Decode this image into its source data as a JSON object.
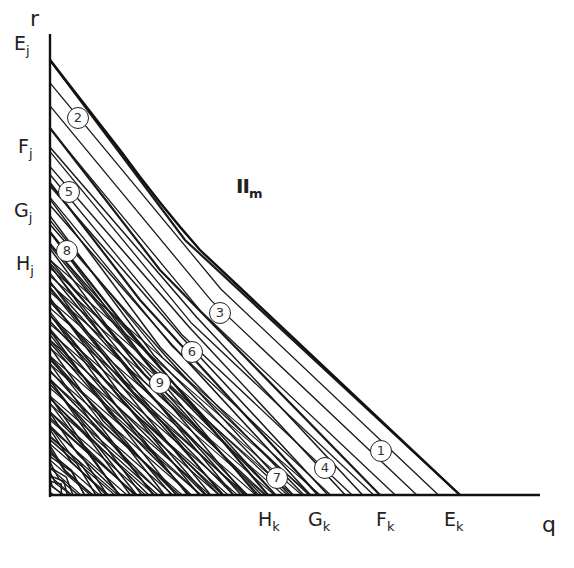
{
  "axes": {
    "y_label": "r",
    "x_label": "q"
  },
  "y_axis_labels": [
    {
      "base": "E",
      "sub": "j",
      "x": 14,
      "y": 34
    },
    {
      "base": "F",
      "sub": "j",
      "x": 18,
      "y": 137
    },
    {
      "base": "G",
      "sub": "j",
      "x": 14,
      "y": 201
    },
    {
      "base": "H",
      "sub": "j",
      "x": 16,
      "y": 254
    }
  ],
  "x_axis_labels": [
    {
      "base": "H",
      "sub": "k",
      "x": 258,
      "y": 510
    },
    {
      "base": "G",
      "sub": "k",
      "x": 308,
      "y": 510
    },
    {
      "base": "F",
      "sub": "k",
      "x": 376,
      "y": 510
    },
    {
      "base": "E",
      "sub": "k",
      "x": 444,
      "y": 510
    }
  ],
  "region_label": {
    "base": "II",
    "sub": "m"
  },
  "markers": [
    {
      "id": "1",
      "x": 381,
      "y": 451
    },
    {
      "id": "2",
      "x": 78,
      "y": 118
    },
    {
      "id": "3",
      "x": 220,
      "y": 313
    },
    {
      "id": "4",
      "x": 325,
      "y": 468
    },
    {
      "id": "5",
      "x": 69,
      "y": 192
    },
    {
      "id": "6",
      "x": 192,
      "y": 352
    },
    {
      "id": "7",
      "x": 277,
      "y": 478
    },
    {
      "id": "8",
      "x": 67,
      "y": 251
    },
    {
      "id": "9",
      "x": 160,
      "y": 383
    }
  ],
  "boundary": {
    "outer": [
      [
        50,
        60
      ],
      [
        185,
        240
      ],
      [
        460,
        495
      ]
    ],
    "families": [
      {
        "name": "E",
        "r_intercept": 60,
        "q_intercept": 460,
        "kink": [
          185,
          240
        ]
      },
      {
        "name": "F",
        "r_intercept": 128,
        "q_intercept": 380,
        "kink": [
          160,
          270
        ]
      },
      {
        "name": "G",
        "r_intercept": 183,
        "q_intercept": 318,
        "kink": [
          140,
          300
        ]
      },
      {
        "name": "H",
        "r_intercept": 232,
        "q_intercept": 268,
        "kink": [
          120,
          320
        ]
      }
    ]
  },
  "colors": {
    "ink": "#1a1a1a",
    "paper": "#ffffff"
  }
}
